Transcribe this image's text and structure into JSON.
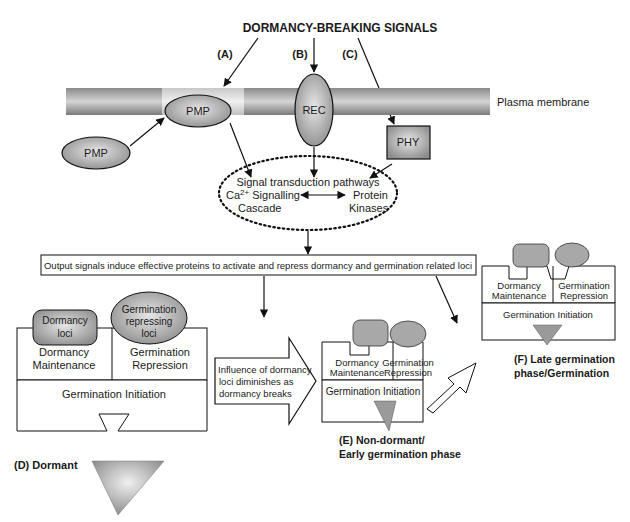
{
  "title": "DORMANCY-BREAKING SIGNALS",
  "signal_labels": {
    "a": "(A)",
    "b": "(B)",
    "c": "(C)"
  },
  "membrane_label": "Plasma membrane",
  "nodes": {
    "pmp_upper": "PMP",
    "pmp_lower": "PMP",
    "rec": "REC",
    "phy": "PHY"
  },
  "transduction": {
    "title": "Signal transduction pathways",
    "ca_line1": "Ca",
    "ca_sup": "2+",
    "ca_line1_rest": " Signalling",
    "ca_line2": "Cascade",
    "kinase_line1": "Protein",
    "kinase_line2": "Kinases"
  },
  "output_box": "Output signals induce effective proteins to activate and repress dormancy and germination related loci",
  "stage_d": {
    "dormancy_loci_1": "Dormancy",
    "dormancy_loci_2": "loci",
    "germ_rep_loci_1": "Germination",
    "germ_rep_loci_2": "repressing",
    "germ_rep_loci_3": "loci",
    "maint_1": "Dormancy",
    "maint_2": "Maintenance",
    "rep_1": "Germination",
    "rep_2": "Repression",
    "initiation": "Germination Initiation",
    "label": "(D) Dormant"
  },
  "transition_arrow": {
    "line1": "Influence of dormancy",
    "line2": "loci diminishes as",
    "line3": "dormancy breaks"
  },
  "stage_e": {
    "maint_1": "Dormancy",
    "maint_2": "Maintenance",
    "rep_1": "Germination",
    "rep_2": "Repression",
    "initiation": "Germination Initiation",
    "label_1": "(E) Non-dormant/",
    "label_2": "Early germination phase"
  },
  "stage_f": {
    "maint_1": "Dormancy",
    "maint_2": "Maintenance",
    "rep_1": "Germination",
    "rep_2": "Repression",
    "initiation": "Germination Initiation",
    "label_1": "(F) Late germination",
    "label_2": "phase/Germination"
  }
}
